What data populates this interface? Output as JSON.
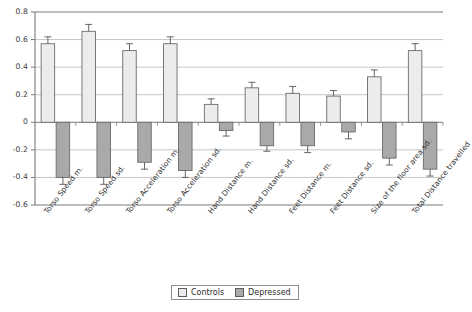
{
  "chart_data": {
    "type": "bar",
    "title": "",
    "xlabel": "",
    "ylabel": "",
    "ylim": [
      -0.6,
      0.8
    ],
    "yticks": [
      "0.8",
      "0.6",
      "0.4",
      "0.2",
      "0",
      "-0.2",
      "-0.4",
      "-0.6"
    ],
    "ytick_values": [
      0.8,
      0.6,
      0.4,
      0.2,
      0,
      -0.2,
      -0.4,
      -0.6
    ],
    "grid": true,
    "legend_position": "bottom-center",
    "error_bars": true,
    "categories": [
      "Torso Speed m.",
      "Torso Speed sd.",
      "Torso Acceleration m.",
      "Torso Acceleration sd.",
      "Hand Distance m.",
      "Hand Distance sd.",
      "Feet Distance m.",
      "Feet Distance sd.",
      "Size of the floor area sd.",
      "Total Distance travelled"
    ],
    "series": [
      {
        "name": "Controls",
        "color": "#ececec",
        "edge": "#6b6b6b",
        "values": [
          0.57,
          0.66,
          0.52,
          0.57,
          0.13,
          0.25,
          0.21,
          0.19,
          0.33,
          0.52
        ],
        "errors": [
          0.05,
          0.05,
          0.05,
          0.05,
          0.04,
          0.04,
          0.05,
          0.04,
          0.05,
          0.05
        ]
      },
      {
        "name": "Depressed",
        "color": "#a9a9a9",
        "edge": "#6b6b6b",
        "values": [
          -0.4,
          -0.4,
          -0.29,
          -0.35,
          -0.06,
          -0.17,
          -0.17,
          -0.07,
          -0.26,
          -0.34
        ],
        "errors": [
          0.05,
          0.05,
          0.05,
          0.05,
          0.04,
          0.04,
          0.05,
          0.05,
          0.05,
          0.05
        ]
      }
    ]
  },
  "legend": {
    "items": [
      {
        "label": "Controls"
      },
      {
        "label": "Depressed"
      }
    ]
  },
  "colors": {
    "controls": "#ececec",
    "depressed": "#a9a9a9",
    "grid": "#b8b8b8",
    "axis": "#7a7a7a",
    "text": "#2b2b2b"
  }
}
